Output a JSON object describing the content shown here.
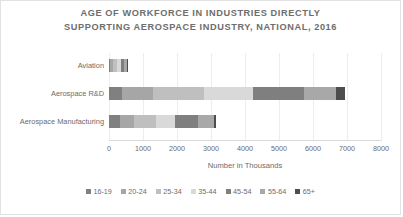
{
  "chart_data": {
    "type": "bar",
    "orientation": "horizontal",
    "stacked": true,
    "title": "AGE OF WORKFORCE IN INDUSTRIES DIRECTLY SUPPORTING AEROSPACE INDUSTRY, NATIONAL, 2016",
    "title_line1": "AGE OF WORKFORCE IN INDUSTRIES DIRECTLY",
    "title_line2": "SUPPORTING AEROSPACE INDUSTRY, NATIONAL, 2016",
    "xlabel": "Number in Thousands",
    "ylabel": "",
    "xlim": [
      0,
      8000
    ],
    "xticks": [
      0,
      1000,
      2000,
      3000,
      4000,
      5000,
      6000,
      7000,
      8000
    ],
    "xtick_labels": [
      "0",
      "1000",
      "2000",
      "3000",
      "4000",
      "5000",
      "6000",
      "7000",
      "8000"
    ],
    "grid": true,
    "grid_axis": "x",
    "legend_position": "bottom",
    "categories": [
      "Aviation",
      "Aerospace R&D",
      "Aerospace Manufacturing"
    ],
    "series": [
      {
        "name": "16-19",
        "color": "#808080",
        "values": [
          40,
          380,
          330
        ]
      },
      {
        "name": "20-24",
        "color": "#a6a6a6",
        "values": [
          70,
          900,
          420
        ]
      },
      {
        "name": "25-34",
        "color": "#bfbfbf",
        "values": [
          120,
          1500,
          620
        ]
      },
      {
        "name": "35-44",
        "color": "#d9d9d9",
        "values": [
          110,
          1450,
          560
        ]
      },
      {
        "name": "45-54",
        "color": "#7f7f7f",
        "values": [
          110,
          1500,
          700
        ]
      },
      {
        "name": "55-64",
        "color": "#a8a8a8",
        "values": [
          80,
          950,
          450
        ]
      },
      {
        "name": "65+",
        "color": "#4d4d4d",
        "values": [
          30,
          270,
          70
        ]
      }
    ],
    "totals": [
      560,
      6950,
      3150
    ]
  },
  "legend": {
    "items": [
      {
        "label": "16-19"
      },
      {
        "label": "20-24"
      },
      {
        "label": "25-34"
      },
      {
        "label": "35-44"
      },
      {
        "label": "45-54"
      },
      {
        "label": "55-64"
      },
      {
        "label": "65+"
      }
    ]
  }
}
